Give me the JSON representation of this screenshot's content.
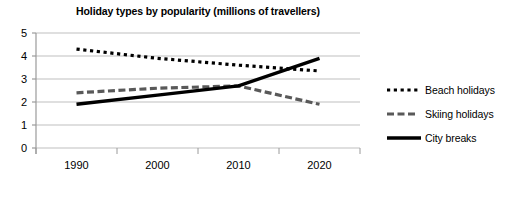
{
  "chart_data": {
    "type": "line",
    "title": "Holiday types by popularity (millions of travellers)",
    "xlabel": "",
    "ylabel": "",
    "categories": [
      "1990",
      "2000",
      "2010",
      "2020"
    ],
    "x": [
      1990,
      2000,
      2010,
      2020
    ],
    "ylim": [
      0,
      5
    ],
    "yticks": [
      0,
      1,
      2,
      3,
      4,
      5
    ],
    "ytick_labels": [
      "0",
      "1",
      "2",
      "3",
      "4",
      "5"
    ],
    "grid": true,
    "legend_position": "right",
    "series": [
      {
        "name": "Beach holidays",
        "style": "dotted",
        "color": "#000000",
        "values": [
          4.3,
          3.9,
          3.6,
          3.35
        ]
      },
      {
        "name": "Skiing holidays",
        "style": "dashed",
        "color": "#595959",
        "values": [
          2.4,
          2.6,
          2.7,
          1.9
        ]
      },
      {
        "name": "City breaks",
        "style": "solid",
        "color": "#000000",
        "values": [
          1.9,
          2.3,
          2.7,
          3.9
        ]
      }
    ]
  },
  "axis": {
    "y_labels": [
      "5",
      "4",
      "3",
      "2",
      "1",
      "0"
    ],
    "x_labels": [
      "1990",
      "2000",
      "2010",
      "2020"
    ]
  },
  "legend": {
    "items": [
      {
        "label": "Beach holidays",
        "swatch": "dotted-line-swatch"
      },
      {
        "label": "Skiing holidays",
        "swatch": "dashed-line-swatch"
      },
      {
        "label": "City breaks",
        "swatch": "solid-line-swatch"
      }
    ]
  }
}
